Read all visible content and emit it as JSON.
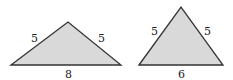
{
  "triangles": [
    {
      "left_side": "5",
      "right_side": "5",
      "base": "8"
    },
    {
      "left_side": "5",
      "right_side": "5",
      "base": "6"
    }
  ],
  "colors": {
    "fill": "#d9d9d9",
    "stroke": "#333333"
  }
}
